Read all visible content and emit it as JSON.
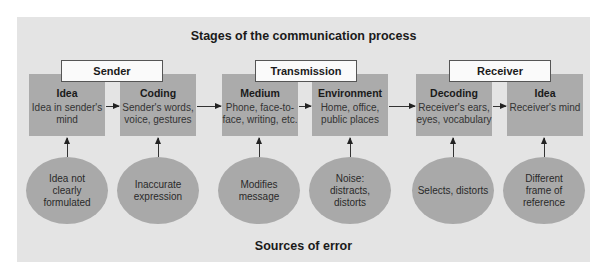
{
  "diagram": {
    "title": "Stages of the communication process",
    "footer": "Sources of error",
    "colors": {
      "panel": "#e4e4e4",
      "stage_box": "#ababab",
      "group_box": "#fafafa",
      "error_ellipse": "#a9a9a9"
    },
    "groups": [
      {
        "label": "Sender"
      },
      {
        "label": "Transmission"
      },
      {
        "label": "Receiver"
      }
    ],
    "stages": [
      {
        "name": "Idea",
        "desc": "Idea in sender's mind",
        "error": "Idea not clearly formulated"
      },
      {
        "name": "Coding",
        "desc": "Sender's words, voice, gestures",
        "error": "Inaccurate expression"
      },
      {
        "name": "Medium",
        "desc": "Phone, face-to-face, writing, etc.",
        "error": "Modifies message"
      },
      {
        "name": "Environment",
        "desc": "Home, office, public places",
        "error": "Noise: distracts, distorts"
      },
      {
        "name": "Decoding",
        "desc": "Receiver's ears, eyes, vocabulary",
        "error": "Selects, distorts"
      },
      {
        "name": "Idea",
        "desc": "Receiver's mind",
        "error": "Different frame of reference"
      }
    ]
  }
}
